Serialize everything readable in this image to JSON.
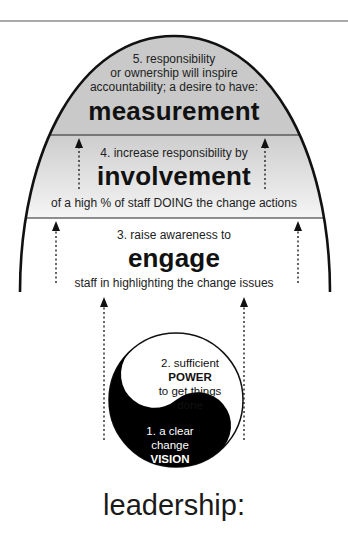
{
  "diagram": {
    "title": "leadership:",
    "colors": {
      "outline": "#111111",
      "band_top_fill": "#c9c9c9",
      "band_mid_fill_top": "#cfcfcf",
      "band_mid_fill_bottom": "#f4f4f4",
      "band_low_fill": "#ffffff",
      "yin": "#000000",
      "yang": "#ffffff"
    },
    "levels": [
      {
        "id": 5,
        "lines": [
          "5. responsibility",
          "or ownership will inspire",
          "accountability; a desire to have:"
        ],
        "keyword": "measurement"
      },
      {
        "id": 4,
        "intro": "4. increase responsibility by",
        "keyword": "involvement",
        "outro": "of a high % of staff DOING the change actions"
      },
      {
        "id": 3,
        "intro": "3. raise awareness to",
        "keyword": "engage",
        "outro": "staff in highlighting the change issues"
      }
    ],
    "foundation": {
      "power": {
        "intro": "2. sufficient",
        "keyword": "POWER",
        "outro_1": "to get things",
        "outro_2": "done"
      },
      "vision": {
        "intro": "1. a clear",
        "line2": "change",
        "keyword": "VISION"
      }
    },
    "arrows": [
      {
        "name": "arrow-mid-left"
      },
      {
        "name": "arrow-mid-right"
      },
      {
        "name": "arrow-low-left"
      },
      {
        "name": "arrow-low-right"
      },
      {
        "name": "arrow-base-left"
      },
      {
        "name": "arrow-base-right"
      }
    ]
  }
}
